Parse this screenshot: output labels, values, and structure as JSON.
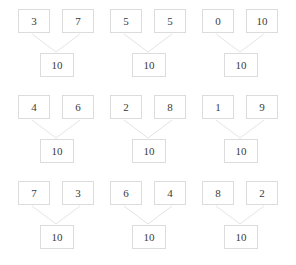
{
  "worksheet": {
    "title": "Number Bonds to 10",
    "target_sum": "10",
    "grid": {
      "columns": 3,
      "rows": 3
    },
    "groups": [
      {
        "id": "bond-1",
        "addend_left": "3",
        "addend_right": "7",
        "sum": "10",
        "x": 18,
        "y": 9
      },
      {
        "id": "bond-2",
        "addend_left": "5",
        "addend_right": "5",
        "sum": "10",
        "x": 110,
        "y": 9
      },
      {
        "id": "bond-3",
        "addend_left": "0",
        "addend_right": "10",
        "sum": "10",
        "x": 202,
        "y": 9
      },
      {
        "id": "bond-4",
        "addend_left": "4",
        "addend_right": "6",
        "sum": "10",
        "x": 18,
        "y": 95
      },
      {
        "id": "bond-5",
        "addend_left": "2",
        "addend_right": "8",
        "sum": "10",
        "x": 110,
        "y": 95
      },
      {
        "id": "bond-6",
        "addend_left": "1",
        "addend_right": "9",
        "sum": "10",
        "x": 202,
        "y": 95
      },
      {
        "id": "bond-7",
        "addend_left": "7",
        "addend_right": "3",
        "sum": "10",
        "x": 18,
        "y": 181
      },
      {
        "id": "bond-8",
        "addend_left": "6",
        "addend_right": "4",
        "sum": "10",
        "x": 110,
        "y": 181
      },
      {
        "id": "bond-9",
        "addend_left": "8",
        "addend_right": "2",
        "sum": "10",
        "x": 202,
        "y": 181
      }
    ]
  },
  "colors": {
    "background": "#ffffff",
    "box_border": "#dcdcdc",
    "connector_line": "#e4e4e4",
    "text": "#3a3a3a"
  }
}
